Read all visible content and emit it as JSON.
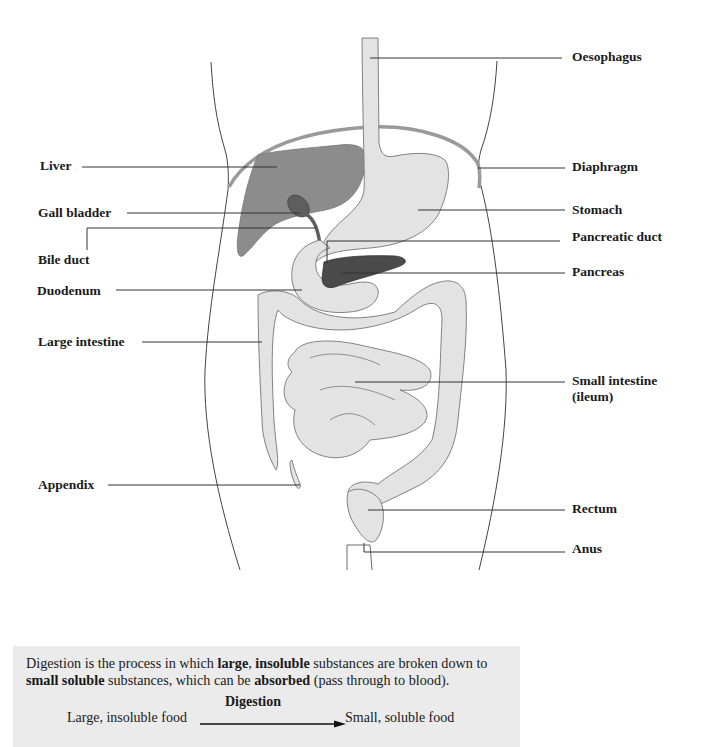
{
  "diagram": {
    "colors": {
      "organ_light": "#e3e3e3",
      "liver": "#8c8c8c",
      "gall_bladder": "#5e5e5e",
      "pancreas": "#4a4a4a",
      "outline": "#555555",
      "diaphragm": "#9a9a9a",
      "leader_line": "#333333",
      "caption_bg": "#ebebeb"
    },
    "labels_left": [
      {
        "id": "liver",
        "text": "Liver",
        "x": 40,
        "y": 158
      },
      {
        "id": "gall-bladder",
        "text": "Gall bladder",
        "x": 38,
        "y": 205
      },
      {
        "id": "bile-duct",
        "text": "Bile duct",
        "x": 38,
        "y": 252
      },
      {
        "id": "duodenum",
        "text": "Duodenum",
        "x": 37,
        "y": 283
      },
      {
        "id": "large-intestine",
        "text": "Large intestine",
        "x": 38,
        "y": 334
      },
      {
        "id": "appendix",
        "text": "Appendix",
        "x": 38,
        "y": 477
      }
    ],
    "labels_right": [
      {
        "id": "oesophagus",
        "text": "Oesophagus",
        "x": 572,
        "y": 49
      },
      {
        "id": "diaphragm",
        "text": "Diaphragm",
        "x": 572,
        "y": 159
      },
      {
        "id": "stomach",
        "text": "Stomach",
        "x": 572,
        "y": 202
      },
      {
        "id": "pancreatic-duct",
        "text": "Pancreatic duct",
        "x": 572,
        "y": 229
      },
      {
        "id": "pancreas",
        "text": "Pancreas",
        "x": 572,
        "y": 264
      },
      {
        "id": "small-intestine",
        "text": "Small intestine (ileum)",
        "x": 572,
        "y": 373
      },
      {
        "id": "rectum",
        "text": "Rectum",
        "x": 572,
        "y": 501
      },
      {
        "id": "anus",
        "text": "Anus",
        "x": 572,
        "y": 541
      }
    ]
  },
  "caption": {
    "sentence_parts": [
      {
        "text": "Digestion is the process in which ",
        "bold": false
      },
      {
        "text": "large",
        "bold": true
      },
      {
        "text": ", ",
        "bold": false
      },
      {
        "text": "insoluble",
        "bold": true
      },
      {
        "text": " substances are broken down to ",
        "bold": false
      },
      {
        "text": "small soluble",
        "bold": true
      },
      {
        "text": " substances, which can be ",
        "bold": false
      },
      {
        "text": "absorbed",
        "bold": true
      },
      {
        "text": " (pass through to blood).",
        "bold": false
      }
    ],
    "flow": {
      "process_label": "Digestion",
      "from": "Large, insoluble food",
      "to": "Small, soluble food"
    }
  }
}
